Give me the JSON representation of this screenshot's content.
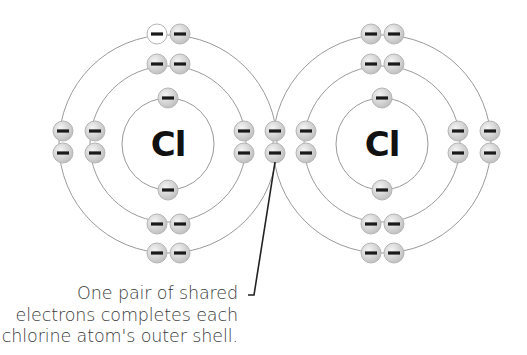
{
  "colors": {
    "background": "#ffffff",
    "shell_line": "#9a9a9a",
    "electron_fill": "#d4d4d4",
    "electron_highlight": "#f2f2f2",
    "electron_unfilled": "#ffffff",
    "electron_outline": "#b5b5b5",
    "minus_sign": "#1a1a1a",
    "symbol": "#111111",
    "pointer": "#222222",
    "caption_text": "#3a3a3a"
  },
  "atoms": [
    {
      "id": "left",
      "symbol": "Cl",
      "center": [
        168,
        144
      ],
      "shell_radii": [
        46,
        78,
        109
      ],
      "electrons": [
        {
          "shell": 1,
          "x": 168,
          "y": 98,
          "filled": true
        },
        {
          "shell": 1,
          "x": 168,
          "y": 190,
          "filled": true
        },
        {
          "shell": 2,
          "x": 157,
          "y": 64,
          "filled": true
        },
        {
          "shell": 2,
          "x": 180,
          "y": 64,
          "filled": true
        },
        {
          "shell": 2,
          "x": 157,
          "y": 224,
          "filled": true
        },
        {
          "shell": 2,
          "x": 180,
          "y": 224,
          "filled": true
        },
        {
          "shell": 2,
          "x": 95,
          "y": 131,
          "filled": true
        },
        {
          "shell": 2,
          "x": 95,
          "y": 153,
          "filled": true
        },
        {
          "shell": 2,
          "x": 244,
          "y": 131,
          "filled": true
        },
        {
          "shell": 2,
          "x": 244,
          "y": 153,
          "filled": true
        },
        {
          "shell": 3,
          "x": 157,
          "y": 34,
          "filled": false
        },
        {
          "shell": 3,
          "x": 180,
          "y": 34,
          "filled": true
        },
        {
          "shell": 3,
          "x": 157,
          "y": 253,
          "filled": true
        },
        {
          "shell": 3,
          "x": 180,
          "y": 253,
          "filled": true
        },
        {
          "shell": 3,
          "x": 63,
          "y": 131,
          "filled": true
        },
        {
          "shell": 3,
          "x": 63,
          "y": 153,
          "filled": true
        }
      ]
    },
    {
      "id": "right",
      "symbol": "Cl",
      "center": [
        382,
        144
      ],
      "shell_radii": [
        46,
        78,
        109
      ],
      "electrons": [
        {
          "shell": 1,
          "x": 382,
          "y": 98,
          "filled": true
        },
        {
          "shell": 1,
          "x": 382,
          "y": 190,
          "filled": true
        },
        {
          "shell": 2,
          "x": 371,
          "y": 64,
          "filled": true
        },
        {
          "shell": 2,
          "x": 394,
          "y": 64,
          "filled": true
        },
        {
          "shell": 2,
          "x": 371,
          "y": 224,
          "filled": true
        },
        {
          "shell": 2,
          "x": 394,
          "y": 224,
          "filled": true
        },
        {
          "shell": 2,
          "x": 306,
          "y": 131,
          "filled": true
        },
        {
          "shell": 2,
          "x": 306,
          "y": 153,
          "filled": true
        },
        {
          "shell": 2,
          "x": 458,
          "y": 131,
          "filled": true
        },
        {
          "shell": 2,
          "x": 458,
          "y": 153,
          "filled": true
        },
        {
          "shell": 3,
          "x": 371,
          "y": 34,
          "filled": true
        },
        {
          "shell": 3,
          "x": 394,
          "y": 34,
          "filled": true
        },
        {
          "shell": 3,
          "x": 371,
          "y": 253,
          "filled": true
        },
        {
          "shell": 3,
          "x": 394,
          "y": 253,
          "filled": true
        },
        {
          "shell": 3,
          "x": 490,
          "y": 131,
          "filled": true
        },
        {
          "shell": 3,
          "x": 490,
          "y": 153,
          "filled": true
        }
      ]
    }
  ],
  "shared_pair": [
    {
      "x": 275,
      "y": 131,
      "filled": true
    },
    {
      "x": 275,
      "y": 153,
      "filled": true
    }
  ],
  "electron_radius": 10,
  "pointer": {
    "points": [
      [
        275,
        162
      ],
      [
        254,
        295
      ],
      [
        248,
        295
      ]
    ]
  },
  "caption": {
    "lines": [
      "One pair of shared",
      "electrons completes each",
      "chlorine atom's outer shell."
    ]
  }
}
